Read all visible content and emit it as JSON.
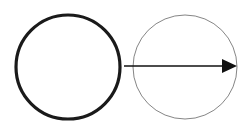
{
  "diagram": {
    "colors": {
      "background": "#ffffff",
      "thick_circle_stroke": "#1a1a1a",
      "thin_circle_stroke": "#777777",
      "arrow": "#111111"
    },
    "shapes": [
      {
        "id": "left-circle",
        "type": "circle",
        "cx": 68,
        "cy": 67,
        "r": 52,
        "stroke_width": 3.2
      },
      {
        "id": "right-circle",
        "type": "circle",
        "cx": 185,
        "cy": 67,
        "r": 52,
        "stroke_width": 0.9
      },
      {
        "id": "arrow",
        "type": "arrow",
        "x1": 124,
        "y1": 66,
        "x2": 237,
        "y2": 66,
        "direction": "right"
      }
    ]
  }
}
